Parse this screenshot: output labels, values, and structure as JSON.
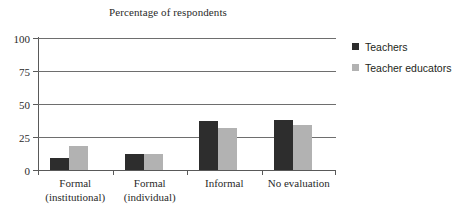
{
  "chart_data": {
    "type": "bar",
    "title": "Percentage of respondents",
    "xlabel": "",
    "ylabel": "",
    "ylim": [
      0,
      100
    ],
    "yticks": [
      0,
      25,
      50,
      75,
      100
    ],
    "ytick_labels": [
      "0",
      "25",
      "50",
      "75",
      "100"
    ],
    "grid": true,
    "legend_position": "right",
    "categories": [
      "Formal (institutional)",
      "Formal (individual)",
      "Informal",
      "No evaluation"
    ],
    "category_lines": [
      [
        "Formal",
        "(institutional)"
      ],
      [
        "Formal",
        "(individual)"
      ],
      [
        "Informal",
        ""
      ],
      [
        "No evaluation",
        ""
      ]
    ],
    "series": [
      {
        "name": "Teachers",
        "color": "#2d2d2d",
        "values": [
          9,
          12,
          37,
          38
        ]
      },
      {
        "name": "Teacher educators",
        "color": "#b2b2b2",
        "values": [
          18,
          12,
          32,
          34
        ]
      }
    ]
  },
  "legend": {
    "items": [
      {
        "label": "Teachers",
        "swatch_name": "legend-swatch-teachers"
      },
      {
        "label": "Teacher educators",
        "swatch_name": "legend-swatch-teacher-educators"
      }
    ]
  },
  "colors": {
    "teachers": "#2d2d2d",
    "teacher_educators": "#b2b2b2",
    "axis": "#595959",
    "gridline": "#6e6e6e",
    "text": "#2a2a2a",
    "background": "#ffffff"
  }
}
